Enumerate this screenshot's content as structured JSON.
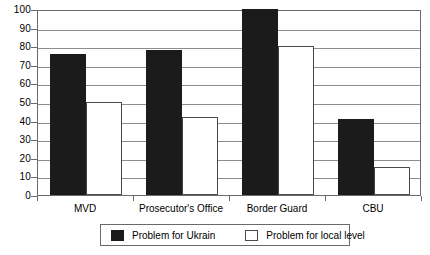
{
  "chart_data": {
    "type": "bar",
    "title": "",
    "subtitle": "",
    "xlabel": "",
    "ylabel": "",
    "categories": [
      "MVD",
      "Prosecutor's Office",
      "Border Guard",
      "CBU"
    ],
    "series": [
      {
        "name": "Problem for Ukrain",
        "swatch": "dark",
        "color": "#1b1b1b",
        "values": [
          76,
          78,
          100,
          41
        ]
      },
      {
        "name": "Problem for local level",
        "swatch": "light",
        "color": "#ffffff",
        "values": [
          50,
          42,
          80,
          15
        ]
      }
    ],
    "ylim": [
      0,
      100
    ],
    "ytick_labels": [
      "100",
      "90",
      "80",
      "70",
      "60",
      "50",
      "40",
      "30",
      "20",
      "10",
      "0"
    ],
    "ytick_values": [
      100,
      90,
      80,
      70,
      60,
      50,
      40,
      30,
      20,
      10,
      0
    ],
    "grid": true,
    "grid_axis": "y",
    "legend_position": "bottom",
    "annotations": []
  },
  "legend": {
    "entries": [
      {
        "label": "Problem for Ukrain"
      },
      {
        "label": "Problem for local level"
      }
    ]
  }
}
